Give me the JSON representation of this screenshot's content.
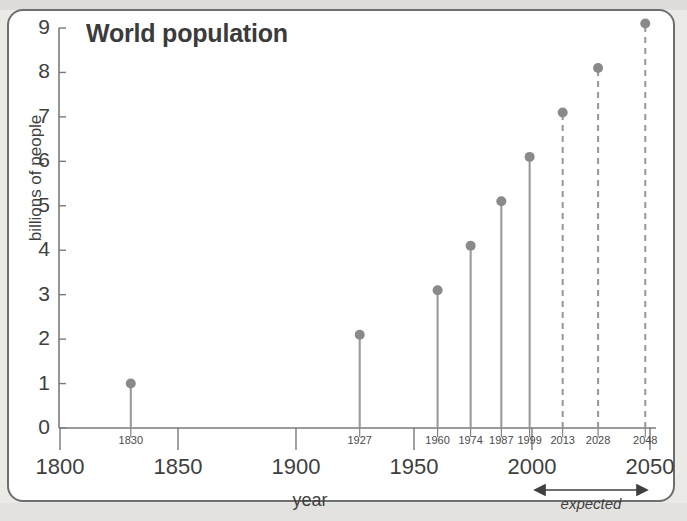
{
  "chart_data": {
    "type": "scatter",
    "title": "World population",
    "xlabel": "year",
    "ylabel": "billions of people",
    "xlim": [
      1800,
      2050
    ],
    "ylim": [
      0,
      9
    ],
    "grid": false,
    "legend": "none",
    "x_major_ticks": [
      1800,
      1850,
      1900,
      1950,
      2000,
      2050
    ],
    "x_major_tick_labels": [
      "1800",
      "1850",
      "1900",
      "1950",
      "2000",
      "2050"
    ],
    "y_ticks": [
      0,
      1,
      2,
      3,
      4,
      5,
      6,
      7,
      8,
      9
    ],
    "y_tick_labels": [
      "0",
      "1",
      "2",
      "3",
      "4",
      "5",
      "6",
      "7",
      "8",
      "9"
    ],
    "x": [
      1830,
      1927,
      1960,
      1974,
      1987,
      1999,
      2013,
      2028,
      2048
    ],
    "values": [
      1.0,
      2.1,
      3.1,
      4.1,
      5.1,
      6.1,
      7.1,
      8.1,
      9.1
    ],
    "point_labels": [
      "1830",
      "1927",
      "1960",
      "1974",
      "1987",
      "1999",
      "2013",
      "2028",
      "2048"
    ],
    "stem_style": [
      "solid",
      "solid",
      "solid",
      "solid",
      "solid",
      "solid",
      "dashed",
      "dashed",
      "dashed"
    ],
    "annotations": [
      {
        "text": "expected",
        "from_x": 2000,
        "to_x": 2050,
        "style": "double-arrow"
      }
    ],
    "series_color": "#8a8a8a",
    "axis_color": "#7a7a7a",
    "text_color": "#3f3f3f"
  },
  "colors": {
    "page_background": "#eceae7",
    "card_background": "#ffffff",
    "card_border": "#6e6e6e",
    "marker": "#8a8a8a",
    "stem": "#9a9a9a",
    "axis": "#7a7a7a",
    "text": "#3f3f3f",
    "title": "#3b3b3b"
  },
  "icons": {
    "arrow_left": "arrow-left-icon",
    "arrow_right": "arrow-right-icon"
  }
}
